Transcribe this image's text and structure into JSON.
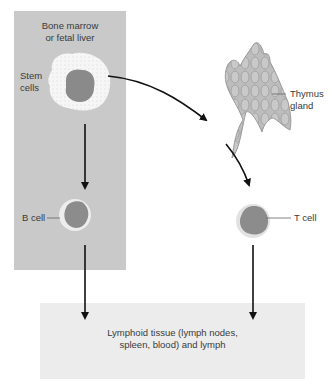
{
  "regions": {
    "bone_marrow": {
      "title_line1": "Bone marrow",
      "title_line2": "or fetal liver"
    },
    "lymphoid": {
      "line1": "Lymphoid tissue (lymph nodes,",
      "line2": "spleen, blood) and lymph"
    }
  },
  "labels": {
    "stem_cells_line1": "Stem",
    "stem_cells_line2": "cells",
    "thymus_line1": "Thymus",
    "thymus_line2": "gland",
    "b_cell": "B cell",
    "t_cell": "T cell"
  },
  "colors": {
    "marrow_box": "#c9c9c9",
    "lymph_box": "#ececec",
    "nucleus": "#8a8a8a",
    "cytoplasm": "#f4f4f4",
    "thymus": "#b5b5b5",
    "arrow": "#111111"
  }
}
